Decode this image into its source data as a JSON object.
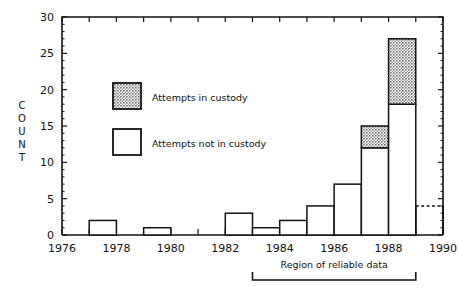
{
  "chart_data": {
    "type": "bar",
    "title": "",
    "subtitle": "",
    "xlabel": "",
    "ylabel": "COUNT",
    "xlim": [
      1976,
      1990
    ],
    "ylim": [
      0,
      30
    ],
    "grid": false,
    "legend_position": "upper-left-inside",
    "y_ticks": [
      0,
      5,
      10,
      15,
      20,
      25,
      30
    ],
    "y_tick_labels": [
      "0",
      "5",
      "10",
      "15",
      "20",
      "25",
      "30"
    ],
    "x_ticks": [
      1976,
      1977,
      1978,
      1979,
      1980,
      1981,
      1982,
      1983,
      1984,
      1985,
      1986,
      1987,
      1988,
      1989,
      1990
    ],
    "x_tick_labels": [
      "1976",
      "",
      "1978",
      "",
      "1980",
      "",
      "1982",
      "",
      "1984",
      "",
      "1986",
      "",
      "1988",
      "",
      "1990"
    ],
    "x_labeled_ticks": [
      {
        "year": 1976,
        "label": "1976"
      },
      {
        "year": 1978,
        "label": "1978"
      },
      {
        "year": 1980,
        "label": "1980"
      },
      {
        "year": 1982,
        "label": "1982"
      },
      {
        "year": 1984,
        "label": "1984"
      },
      {
        "year": 1986,
        "label": "1986"
      },
      {
        "year": 1988,
        "label": "1988"
      },
      {
        "year": 1990,
        "label": "1990"
      }
    ],
    "categories": [
      1976,
      1977,
      1978,
      1979,
      1980,
      1981,
      1982,
      1983,
      1984,
      1985,
      1986,
      1987,
      1988,
      1989
    ],
    "series": [
      {
        "name": "Attempts not in custody",
        "fill": "open",
        "values": [
          0,
          2,
          0,
          1,
          0,
          0,
          3,
          1,
          2,
          4,
          7,
          12,
          18,
          4
        ]
      },
      {
        "name": "Attempts in custody",
        "fill": "hatched",
        "values": [
          0,
          0,
          0,
          0,
          0,
          0,
          0,
          0,
          0,
          0,
          0,
          3,
          9,
          0
        ]
      }
    ],
    "totals": [
      0,
      2,
      0,
      1,
      0,
      0,
      3,
      1,
      2,
      4,
      7,
      15,
      27,
      4
    ],
    "bars": [
      {
        "year": 1976,
        "not_in_custody": 0,
        "in_custody": 0,
        "total": 0,
        "estimated": false
      },
      {
        "year": 1977,
        "not_in_custody": 2,
        "in_custody": 0,
        "total": 2,
        "estimated": false
      },
      {
        "year": 1978,
        "not_in_custody": 0,
        "in_custody": 0,
        "total": 0,
        "estimated": false
      },
      {
        "year": 1979,
        "not_in_custody": 1,
        "in_custody": 0,
        "total": 1,
        "estimated": false
      },
      {
        "year": 1980,
        "not_in_custody": 0,
        "in_custody": 0,
        "total": 0,
        "estimated": false
      },
      {
        "year": 1981,
        "not_in_custody": 0,
        "in_custody": 0,
        "total": 0,
        "estimated": false
      },
      {
        "year": 1982,
        "not_in_custody": 3,
        "in_custody": 0,
        "total": 3,
        "estimated": false
      },
      {
        "year": 1983,
        "not_in_custody": 1,
        "in_custody": 0,
        "total": 1,
        "estimated": false
      },
      {
        "year": 1984,
        "not_in_custody": 2,
        "in_custody": 0,
        "total": 2,
        "estimated": false
      },
      {
        "year": 1985,
        "not_in_custody": 4,
        "in_custody": 0,
        "total": 4,
        "estimated": false
      },
      {
        "year": 1986,
        "not_in_custody": 7,
        "in_custody": 0,
        "total": 7,
        "estimated": false
      },
      {
        "year": 1987,
        "not_in_custody": 12,
        "in_custody": 3,
        "total": 15,
        "estimated": false
      },
      {
        "year": 1988,
        "not_in_custody": 18,
        "in_custody": 9,
        "total": 27,
        "estimated": false
      },
      {
        "year": 1989,
        "not_in_custody": 4,
        "in_custody": 0,
        "total": 4,
        "estimated": true
      }
    ],
    "annotations": [
      {
        "text": "Region of reliable data",
        "x_start": 1983,
        "x_end": 1989
      }
    ]
  },
  "legend": {
    "items": [
      {
        "label": "Attempts in custody",
        "swatch": "hatched"
      },
      {
        "label": "Attempts not in custody",
        "swatch": "open"
      }
    ]
  },
  "axis": {
    "y_title": "COUNT",
    "y_title_letters": [
      "C",
      "O",
      "U",
      "N",
      "T"
    ]
  },
  "annotation": {
    "region_label": "Region of reliable data"
  },
  "colors": {
    "axis": "#111111",
    "bar_stroke": "#111111",
    "bar_open_fill": "#ffffff",
    "hatch_gray": "#8a8a8a",
    "background": "#ffffff"
  }
}
